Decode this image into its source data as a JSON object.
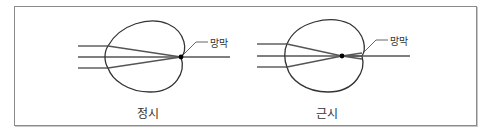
{
  "diagram": {
    "panels": [
      {
        "id": "emmetropia",
        "caption": "정시",
        "retina_label": "망막",
        "focal_point": "on-retina"
      },
      {
        "id": "myopia",
        "caption": "근시",
        "retina_label": "망막",
        "focal_point": "in-front-of-retina"
      }
    ],
    "colors": {
      "frame": "#8a8a8a",
      "outline": "#333333",
      "ray": "#555555",
      "focal_dot": "#000000"
    }
  }
}
